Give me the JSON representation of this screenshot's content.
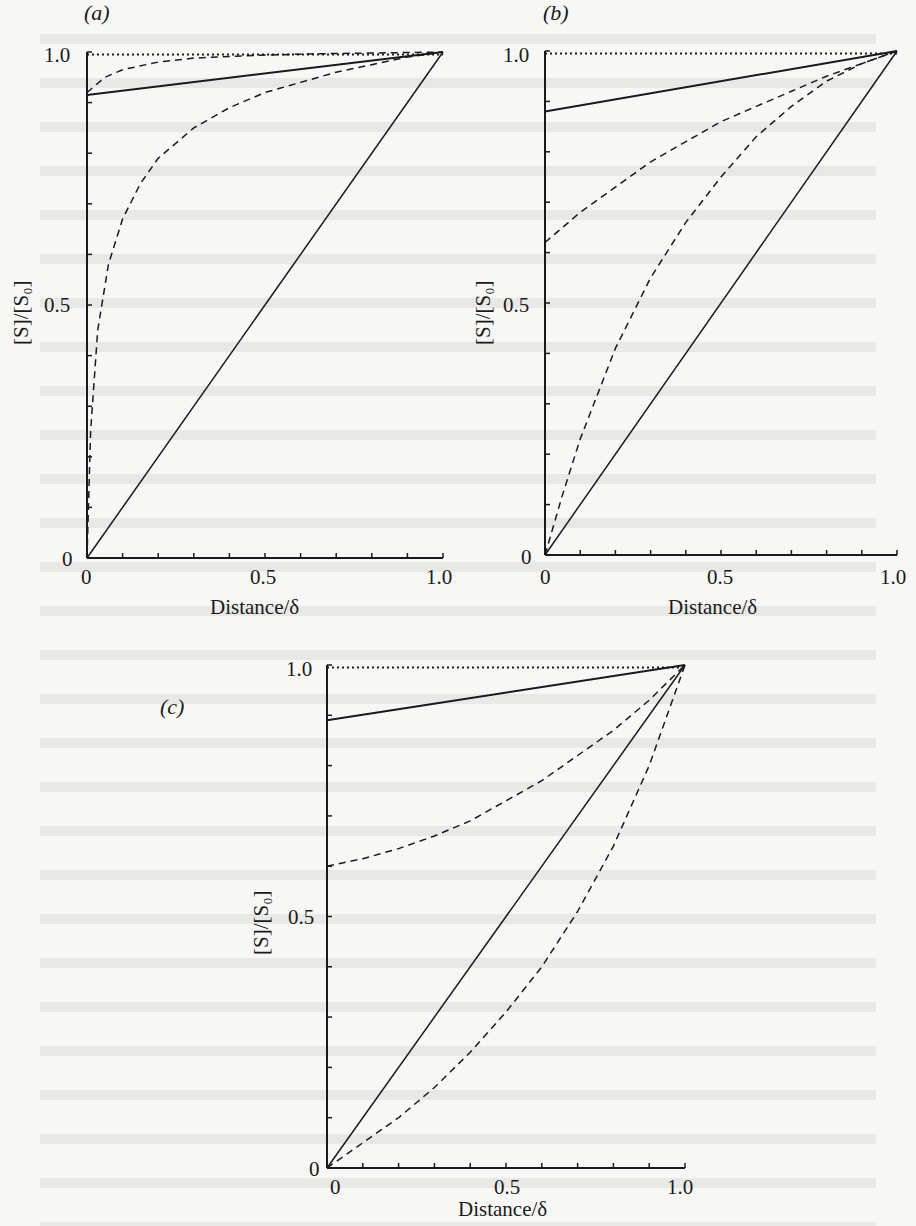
{
  "figure": {
    "panels": [
      "(a)",
      "(b)",
      "(c)"
    ]
  },
  "chart_data": [
    {
      "type": "line",
      "panel_label": "(a)",
      "xlabel": "Distance/δ",
      "ylabel": "[S]/[S₀]",
      "xlim": [
        0,
        1.0
      ],
      "ylim": [
        0,
        1.0
      ],
      "x_ticks": [
        "0",
        "0.5",
        "1.0"
      ],
      "y_ticks": [
        "0",
        "0.5",
        "1.0"
      ],
      "grid": false,
      "legend": null,
      "series": [
        {
          "name": "dotted-top",
          "style": "dotted",
          "x": [
            0,
            1
          ],
          "y": [
            0.995,
            0.995
          ]
        },
        {
          "name": "solid-upper",
          "style": "solid",
          "x": [
            0,
            1
          ],
          "y": [
            0.915,
            1.0
          ]
        },
        {
          "name": "dashed-upper",
          "style": "dashed",
          "x": [
            0,
            0.05,
            0.1,
            0.2,
            0.3,
            0.5,
            0.7,
            1.0
          ],
          "y": [
            0.92,
            0.95,
            0.965,
            0.98,
            0.988,
            0.994,
            0.997,
            1.0
          ]
        },
        {
          "name": "dashed-lower",
          "style": "dashed",
          "x": [
            0,
            0.01,
            0.03,
            0.06,
            0.1,
            0.15,
            0.2,
            0.3,
            0.4,
            0.5,
            0.6,
            0.7,
            0.8,
            0.9,
            1.0
          ],
          "y": [
            0,
            0.25,
            0.45,
            0.58,
            0.67,
            0.74,
            0.79,
            0.85,
            0.89,
            0.92,
            0.94,
            0.96,
            0.975,
            0.99,
            1.0
          ]
        },
        {
          "name": "solid-diagonal",
          "style": "solid",
          "x": [
            0,
            1
          ],
          "y": [
            0,
            1.0
          ]
        }
      ]
    },
    {
      "type": "line",
      "panel_label": "(b)",
      "xlabel": "Distance/δ",
      "ylabel": "[S]/[S₀]",
      "xlim": [
        0,
        1.0
      ],
      "ylim": [
        0,
        1.0
      ],
      "x_ticks": [
        "0",
        "0.5",
        "1.0"
      ],
      "y_ticks": [
        "0",
        "0.5",
        "1.0"
      ],
      "grid": false,
      "legend": null,
      "series": [
        {
          "name": "dotted-top",
          "style": "dotted",
          "x": [
            0,
            1
          ],
          "y": [
            0.995,
            0.995
          ]
        },
        {
          "name": "solid-upper",
          "style": "solid",
          "x": [
            0,
            1
          ],
          "y": [
            0.88,
            1.0
          ]
        },
        {
          "name": "dashed-upper",
          "style": "dashed",
          "x": [
            0,
            0.1,
            0.2,
            0.3,
            0.4,
            0.5,
            0.6,
            0.7,
            0.8,
            0.9,
            1.0
          ],
          "y": [
            0.62,
            0.68,
            0.73,
            0.78,
            0.82,
            0.86,
            0.89,
            0.92,
            0.95,
            0.975,
            1.0
          ]
        },
        {
          "name": "dashed-lower",
          "style": "dashed",
          "x": [
            0,
            0.05,
            0.1,
            0.2,
            0.3,
            0.4,
            0.5,
            0.6,
            0.7,
            0.8,
            0.9,
            1.0
          ],
          "y": [
            0,
            0.12,
            0.23,
            0.41,
            0.55,
            0.66,
            0.75,
            0.83,
            0.89,
            0.94,
            0.975,
            1.0
          ]
        },
        {
          "name": "solid-diagonal",
          "style": "solid",
          "x": [
            0,
            1
          ],
          "y": [
            0,
            1.0
          ]
        }
      ]
    },
    {
      "type": "line",
      "panel_label": "(c)",
      "xlabel": "Distance/δ",
      "ylabel": "[S]/[S₀]",
      "xlim": [
        0,
        1.0
      ],
      "ylim": [
        0,
        1.0
      ],
      "x_ticks": [
        "0",
        "0.5",
        "1.0"
      ],
      "y_ticks": [
        "0",
        "0.5",
        "1.0"
      ],
      "grid": false,
      "legend": null,
      "series": [
        {
          "name": "dotted-top",
          "style": "dotted",
          "x": [
            0,
            1
          ],
          "y": [
            0.995,
            0.995
          ]
        },
        {
          "name": "solid-upper",
          "style": "solid",
          "x": [
            0,
            1
          ],
          "y": [
            0.89,
            1.0
          ]
        },
        {
          "name": "dashed-upper",
          "style": "dashed",
          "x": [
            0,
            0.1,
            0.2,
            0.3,
            0.4,
            0.5,
            0.6,
            0.7,
            0.8,
            0.9,
            1.0
          ],
          "y": [
            0.6,
            0.615,
            0.635,
            0.66,
            0.69,
            0.73,
            0.77,
            0.82,
            0.87,
            0.93,
            1.0
          ]
        },
        {
          "name": "dashed-lower",
          "style": "dashed",
          "x": [
            0,
            0.1,
            0.2,
            0.3,
            0.4,
            0.5,
            0.6,
            0.7,
            0.8,
            0.9,
            1.0
          ],
          "y": [
            0,
            0.05,
            0.1,
            0.16,
            0.23,
            0.31,
            0.4,
            0.51,
            0.64,
            0.8,
            1.0
          ]
        },
        {
          "name": "solid-diagonal",
          "style": "solid",
          "x": [
            0,
            1
          ],
          "y": [
            0,
            1.0
          ]
        }
      ]
    }
  ]
}
